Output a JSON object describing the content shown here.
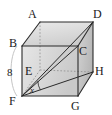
{
  "figure": {
    "type": "geometry-diagram",
    "shape": "cube",
    "colors": {
      "stroke": "#2b2b2b",
      "hidden_stroke": "#8a8a8a",
      "face_light": "#e2e2e2",
      "face_mid": "#d0d0d0",
      "face_dark": "#bdbdbd",
      "measure": "#b9b9b9",
      "label": "#1a1a1a"
    },
    "vertices": [
      {
        "name": "A",
        "label": "A",
        "x": 40,
        "y": 22,
        "label_x": 28,
        "label_y": 8
      },
      {
        "name": "B",
        "label": "B",
        "x": 22,
        "y": 46,
        "label_x": 9,
        "label_y": 37
      },
      {
        "name": "C",
        "label": "C",
        "x": 78,
        "y": 46,
        "label_x": 79,
        "label_y": 45
      },
      {
        "name": "D",
        "label": "D",
        "x": 93,
        "y": 22,
        "label_x": 93,
        "label_y": 8
      },
      {
        "name": "E",
        "label": "E",
        "x": 40,
        "y": 70,
        "label_x": 25,
        "label_y": 65
      },
      {
        "name": "F",
        "label": "F",
        "x": 22,
        "y": 96,
        "label_x": 9,
        "label_y": 95
      },
      {
        "name": "G",
        "label": "G",
        "x": 78,
        "y": 96,
        "label_x": 71,
        "label_y": 100
      },
      {
        "name": "H",
        "label": "H",
        "x": 93,
        "y": 72,
        "label_x": 95,
        "label_y": 65
      }
    ],
    "measurements": [
      {
        "name": "edge-bf-length",
        "value": "8",
        "label_x": 7,
        "label_y": 67
      }
    ],
    "angles": [
      {
        "name": "angle-x-at-f",
        "label": "x",
        "label_x": 30,
        "label_y": 86
      }
    ],
    "diagonal": {
      "from": "F",
      "to": "D",
      "name": "diagonal-fd"
    },
    "secondary_lines": [
      {
        "name": "segment-fh",
        "from": "F",
        "to": "H"
      },
      {
        "name": "segment-fc",
        "from": "F",
        "to": "C"
      }
    ]
  }
}
